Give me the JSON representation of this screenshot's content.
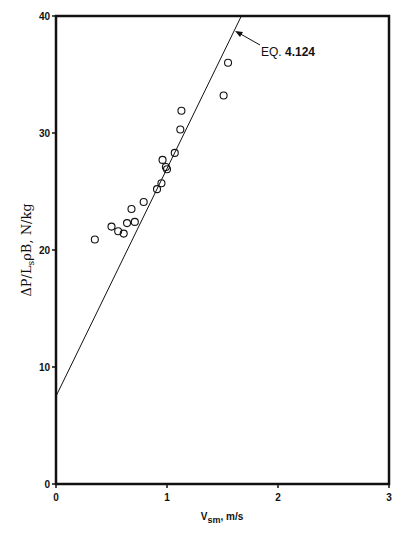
{
  "chart_data": {
    "type": "scatter",
    "title": "",
    "xlabel": "V_sm, m/s",
    "ylabel": "ΔP/L_s ρ_B, N/kg",
    "xlim": [
      0,
      3
    ],
    "ylim": [
      0,
      40
    ],
    "xticks": [
      "0",
      "1",
      "2",
      "3"
    ],
    "yticks": [
      "0",
      "10",
      "20",
      "30",
      "40"
    ],
    "grid": false,
    "series": [
      {
        "name": "Data",
        "type": "scatter",
        "marker": "open-circle",
        "x": [
          0.35,
          0.5,
          0.56,
          0.61,
          0.64,
          0.71,
          0.68,
          0.79,
          0.91,
          0.95,
          0.96,
          0.99,
          1.0,
          1.07,
          1.12,
          1.13,
          1.51,
          1.55
        ],
        "y": [
          20.9,
          22.0,
          21.6,
          21.4,
          22.3,
          22.4,
          23.5,
          24.1,
          25.2,
          25.7,
          27.7,
          27.1,
          26.9,
          28.3,
          30.3,
          31.9,
          33.2,
          36.0
        ]
      },
      {
        "name": "EQ. 4.124",
        "type": "line",
        "x": [
          0,
          1.67
        ],
        "y": [
          7.5,
          40
        ]
      }
    ],
    "annotations": [
      {
        "text": "EQ. 4.124",
        "arrow_to": [
          1.6,
          38.5
        ]
      }
    ]
  },
  "labels": {
    "xlabel_main": "V",
    "xlabel_sub": "sm",
    "xlabel_unit": ", m/s",
    "ylabel": "ΔP/L",
    "ylabel_sub": "s",
    "ylabel_rest": "ρB, N/kg",
    "eq": "EQ.",
    "eq_num": "4.124"
  }
}
